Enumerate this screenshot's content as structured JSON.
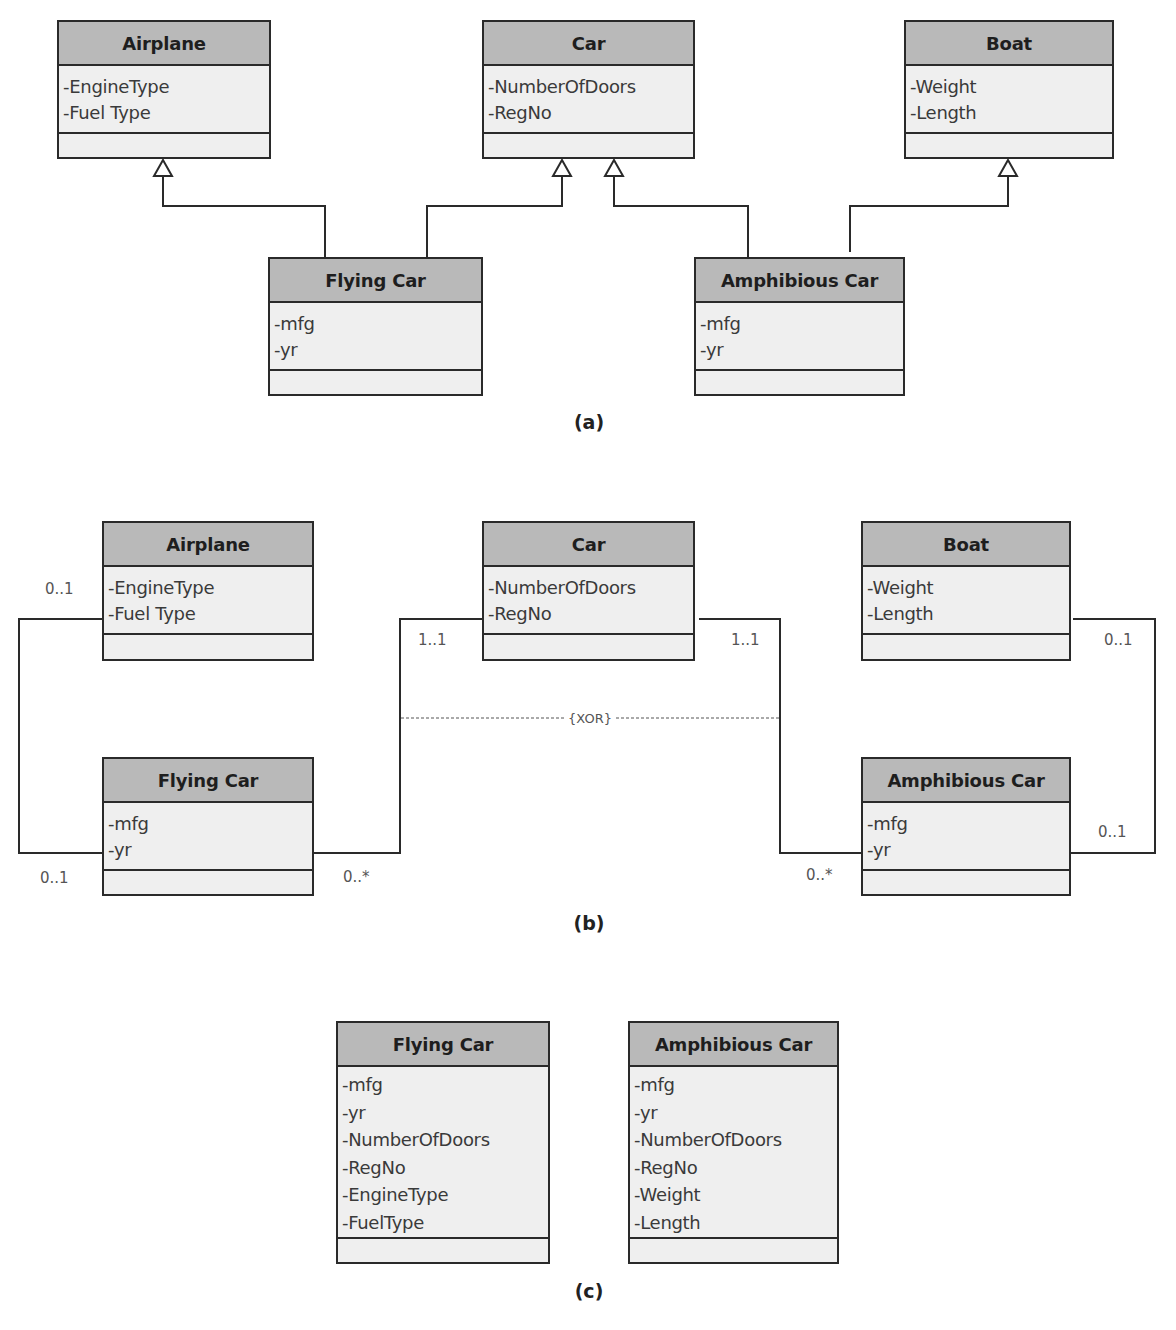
{
  "panel_a": {
    "caption": "(a)",
    "classes": {
      "airplane": {
        "name": "Airplane",
        "attributes": [
          "-EngineType",
          "-Fuel Type"
        ]
      },
      "car": {
        "name": "Car",
        "attributes": [
          "-NumberOfDoors",
          "-RegNo"
        ]
      },
      "boat": {
        "name": "Boat",
        "attributes": [
          "-Weight",
          "-Length"
        ]
      },
      "flying_car": {
        "name": "Flying Car",
        "attributes": [
          "-mfg",
          "-yr"
        ]
      },
      "amphibious_car": {
        "name": "Amphibious Car",
        "attributes": [
          "-mfg",
          "-yr"
        ]
      }
    },
    "relationships": [
      {
        "type": "generalization",
        "from": "Flying Car",
        "to": "Airplane"
      },
      {
        "type": "generalization",
        "from": "Flying Car",
        "to": "Car"
      },
      {
        "type": "generalization",
        "from": "Amphibious Car",
        "to": "Car"
      },
      {
        "type": "generalization",
        "from": "Amphibious Car",
        "to": "Boat"
      }
    ]
  },
  "panel_b": {
    "caption": "(b)",
    "classes": {
      "airplane": {
        "name": "Airplane",
        "attributes": [
          "-EngineType",
          "-Fuel Type"
        ]
      },
      "car": {
        "name": "Car",
        "attributes": [
          "-NumberOfDoors",
          "-RegNo"
        ]
      },
      "boat": {
        "name": "Boat",
        "attributes": [
          "-Weight",
          "-Length"
        ]
      },
      "flying_car": {
        "name": "Flying Car",
        "attributes": [
          "-mfg",
          "-yr"
        ]
      },
      "amphibious_car": {
        "name": "Amphibious Car",
        "attributes": [
          "-mfg",
          "-yr"
        ]
      }
    },
    "multiplicities": {
      "airplane_end": "0..1",
      "flying_car_airplane_end": "0..1",
      "car_left_end": "1..1",
      "flying_car_car_end": "0..*",
      "car_right_end": "1..1",
      "amphibious_car_car_end": "0..*",
      "boat_end": "0..1",
      "amphibious_car_boat_end": "0..1"
    },
    "constraint": "{XOR}",
    "relationships": [
      {
        "type": "association",
        "from": "Airplane",
        "to": "Flying Car",
        "mult": [
          "0..1",
          "0..1"
        ]
      },
      {
        "type": "association",
        "from": "Car",
        "to": "Flying Car",
        "mult": [
          "1..1",
          "0..*"
        ]
      },
      {
        "type": "association",
        "from": "Car",
        "to": "Amphibious Car",
        "mult": [
          "1..1",
          "0..*"
        ]
      },
      {
        "type": "association",
        "from": "Boat",
        "to": "Amphibious Car",
        "mult": [
          "0..1",
          "0..1"
        ]
      }
    ]
  },
  "panel_c": {
    "caption": "(c)",
    "classes": {
      "flying_car": {
        "name": "Flying Car",
        "attributes": [
          "-mfg",
          "-yr",
          "-NumberOfDoors",
          "-RegNo",
          "-EngineType",
          "-FuelType"
        ]
      },
      "amphibious_car": {
        "name": "Amphibious Car",
        "attributes": [
          "-mfg",
          "-yr",
          "-NumberOfDoors",
          "-RegNo",
          "-Weight",
          "-Length"
        ]
      }
    }
  },
  "colors": {
    "header_fill": "#b9b9b9",
    "body_fill": "#efefef",
    "border": "#2a2a2a",
    "line": "#2a2a2a"
  }
}
